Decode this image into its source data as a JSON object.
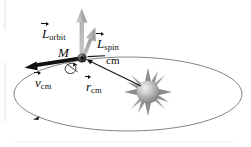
{
  "figure": {
    "background_color": "#ffffff"
  },
  "labels": {
    "l_orbit": {
      "symbol": "L",
      "subscript": "orbit",
      "has_vector_hat": true
    },
    "l_spin": {
      "symbol": "L",
      "subscript": "spin",
      "has_vector_hat": true
    },
    "mass": {
      "symbol": "M"
    },
    "cm_node": {
      "text": "cm"
    },
    "v_cm": {
      "symbol": "v",
      "subscript": "cm",
      "has_vector_hat": true
    },
    "r_cm": {
      "symbol": "r",
      "subscript": "cm",
      "has_vector_hat": true
    }
  },
  "colors": {
    "ink": "#101010",
    "vector_gray": "#b4b4b4",
    "vector_gray_dark": "#8f8f8f",
    "orbit_line": "#7a7a7a",
    "sun_body": "#9a9a9a",
    "sun_highlight": "#e8e8e8",
    "planet": "#2a2a2a"
  },
  "elements": {
    "orbit_ellipse": {
      "name": "orbit-path",
      "cx": 128,
      "cy": 94,
      "rx": 114,
      "ry": 37
    },
    "orbit_direction_marker": {
      "name": "orbit-direction-arrow",
      "x": 36,
      "y": 118
    },
    "planet": {
      "name": "planet-cm-node",
      "x": 82,
      "y": 58,
      "r": 4.5
    },
    "sun": {
      "name": "sun",
      "x": 148,
      "y": 92,
      "r": 11,
      "spikes": 12
    },
    "vector_l_orbit": {
      "name": "l-orbit-vector",
      "x1": 82,
      "y1": 58,
      "x2": 82,
      "y2": 10
    },
    "vector_l_spin": {
      "name": "l-spin-vector",
      "x1": 82,
      "y1": 58,
      "x2": 94,
      "y2": 28
    },
    "vector_v_cm": {
      "name": "v-cm-vector",
      "x1": 82,
      "y1": 58,
      "x2": 26,
      "y2": 67
    },
    "vector_r_cm": {
      "name": "r-cm-vector",
      "x1": 140,
      "y1": 86,
      "x2": 88,
      "y2": 61
    },
    "spin_loop": {
      "name": "spin-rotation-loop",
      "x": 70,
      "y": 69
    },
    "cm_leader_line": {
      "name": "cm-leader-line",
      "x1": 87,
      "y1": 57,
      "x2": 105,
      "y2": 56
    }
  }
}
